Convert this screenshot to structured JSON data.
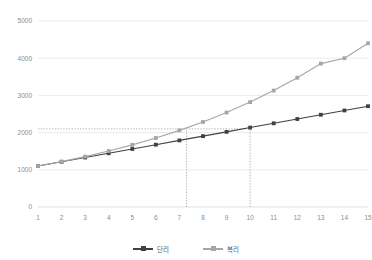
{
  "chart_data": {
    "type": "line",
    "title": "",
    "xlabel": "",
    "ylabel": "",
    "x": [
      1,
      2,
      3,
      4,
      5,
      6,
      7,
      8,
      9,
      10,
      11,
      12,
      13,
      14,
      15
    ],
    "categories": [
      "1",
      "2",
      "3",
      "4",
      "5",
      "6",
      "7",
      "8",
      "9",
      "10",
      "11",
      "12",
      "13",
      "14",
      "15"
    ],
    "series": [
      {
        "name": "단리",
        "color": "#404040",
        "marker": "square",
        "values": [
          1100,
          1215,
          1330,
          1445,
          1560,
          1675,
          1790,
          1905,
          2020,
          2135,
          2250,
          2365,
          2480,
          2595,
          2710
        ]
      },
      {
        "name": "복리",
        "color": "#a6a6a6",
        "marker": "square",
        "values": [
          1100,
          1220,
          1355,
          1505,
          1670,
          1855,
          2060,
          2285,
          2540,
          2820,
          3130,
          3475,
          3855,
          4000,
          4400
        ]
      }
    ],
    "ylim": [
      0,
      5000
    ],
    "yticks": [
      0,
      1000,
      2000,
      3000,
      4000,
      5000
    ],
    "ytick_labels": [
      "0",
      "1000",
      "2000",
      "3000",
      "4000",
      "5000"
    ],
    "xlim": [
      1,
      15
    ],
    "grid": true,
    "legend_position": "bottom",
    "annotations": [
      {
        "type": "hline",
        "value": 2100,
        "style": "dotted",
        "x_from": 1,
        "x_to": 10
      },
      {
        "type": "vline",
        "value": 7.3,
        "style": "dotted",
        "y_from": 0,
        "y_to": 2100
      },
      {
        "type": "vline",
        "value": 10,
        "style": "dotted",
        "y_from": 0,
        "y_to": 2135
      }
    ]
  },
  "legend": {
    "items": [
      {
        "label": "단리"
      },
      {
        "label": "복리"
      }
    ]
  }
}
